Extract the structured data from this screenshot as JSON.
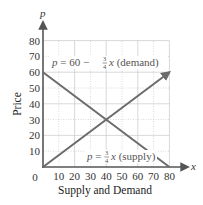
{
  "chart_data": {
    "type": "line",
    "title": "",
    "xlabel": "Supply and Demand",
    "ylabel": "Price",
    "x_axis_var": "x",
    "y_axis_var": "p",
    "xlim": [
      0,
      80
    ],
    "ylim": [
      0,
      80
    ],
    "x_ticks": [
      0,
      10,
      20,
      30,
      40,
      50,
      60,
      70,
      80
    ],
    "y_ticks": [
      10,
      20,
      30,
      40,
      50,
      60,
      70,
      80
    ],
    "origin_label": "0",
    "grid": true,
    "series": [
      {
        "name": "demand",
        "equation": "p = 60 − (3/4)x (demand)",
        "points": [
          [
            0,
            60
          ],
          [
            80,
            0
          ]
        ],
        "color": "#6b6b6b"
      },
      {
        "name": "supply",
        "equation": "p = (3/4)x (supply)",
        "points": [
          [
            0,
            0
          ],
          [
            80,
            60
          ]
        ],
        "color": "#6b6b6b",
        "arrow_end": true
      }
    ],
    "intersection": [
      40,
      30
    ]
  },
  "labels": {
    "demand_eq_prefix": "p = 60 − ",
    "demand_eq_num": "3",
    "demand_eq_den": "4",
    "demand_eq_suffix": "x (demand)",
    "supply_eq_prefix": "p = ",
    "supply_eq_num": "3",
    "supply_eq_den": "4",
    "supply_eq_suffix": "x (supply)"
  },
  "colors": {
    "axis": "#555555",
    "grid": "#c8c8c8",
    "line": "#6b6b6b"
  }
}
